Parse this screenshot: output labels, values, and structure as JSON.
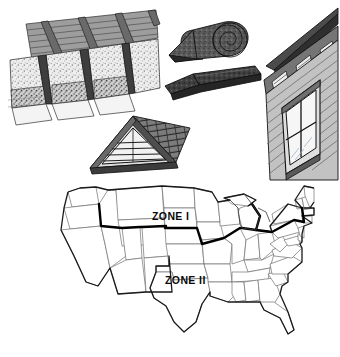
{
  "figure": {
    "background_color": "#ffffff"
  },
  "illustrations": [
    {
      "id": "attic",
      "name": "attic-insulation-between-joists",
      "caption": "Attic rafters and joists with loose-fill insulation between framing",
      "tones": {
        "deck": "#9a9a9a",
        "framing": "#4a4a4a",
        "insulation": "#e8e8e8",
        "outline": "#1a1a1a"
      }
    },
    {
      "id": "roll",
      "name": "insulation-roll-and-batt",
      "caption": "Rolled insulation blanket and flat insulation batt",
      "tones": {
        "roll": "#5d5d5d",
        "batt": "#454545",
        "outline": "#141414"
      }
    },
    {
      "id": "gable",
      "name": "gable-vent-and-shingled-roof",
      "caption": "Gable end with louvered triangular vent and shingled roof",
      "tones": {
        "roof": "#6e6e6e",
        "gable": "#d6d6d6",
        "outline": "#171717"
      }
    },
    {
      "id": "house",
      "name": "clapboard-wall-with-window-and-soffit-vents",
      "caption": "Clapboard siding wall with double-hung window and soffit vents",
      "tones": {
        "siding": "#bdbdbd",
        "shadow": "#8a8a8a",
        "glass": "#f2f2f2",
        "outline": "#161616"
      }
    }
  ],
  "map": {
    "name": "united-states-insulation-zone-map",
    "caption": "Map of the contiguous United States divided into two insulation zones",
    "state_border_color": "#6b6b6b",
    "country_outline_color": "#1a1a1a",
    "zone_divider_color": "#000000",
    "fill_color": "#ffffff",
    "zones": [
      {
        "id": "zone-1",
        "label": "ZONE I",
        "region": "northern"
      },
      {
        "id": "zone-2",
        "label": "ZONE II",
        "region": "southern"
      }
    ]
  }
}
